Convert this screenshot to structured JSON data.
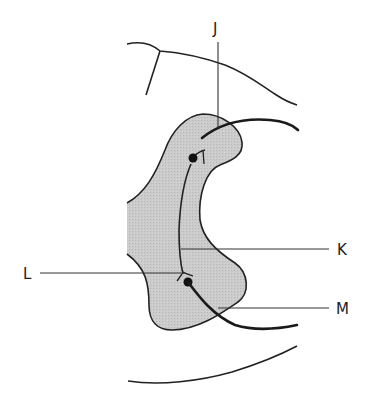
{
  "figure": {
    "type": "anatomical line diagram",
    "colors": {
      "line": "#222222",
      "shaded_region": "#c8c8c8",
      "background": "#ffffff"
    },
    "labels": [
      {
        "id": "J",
        "text": "J"
      },
      {
        "id": "K",
        "text": "K"
      },
      {
        "id": "L",
        "text": "L"
      },
      {
        "id": "M",
        "text": "M"
      }
    ]
  }
}
